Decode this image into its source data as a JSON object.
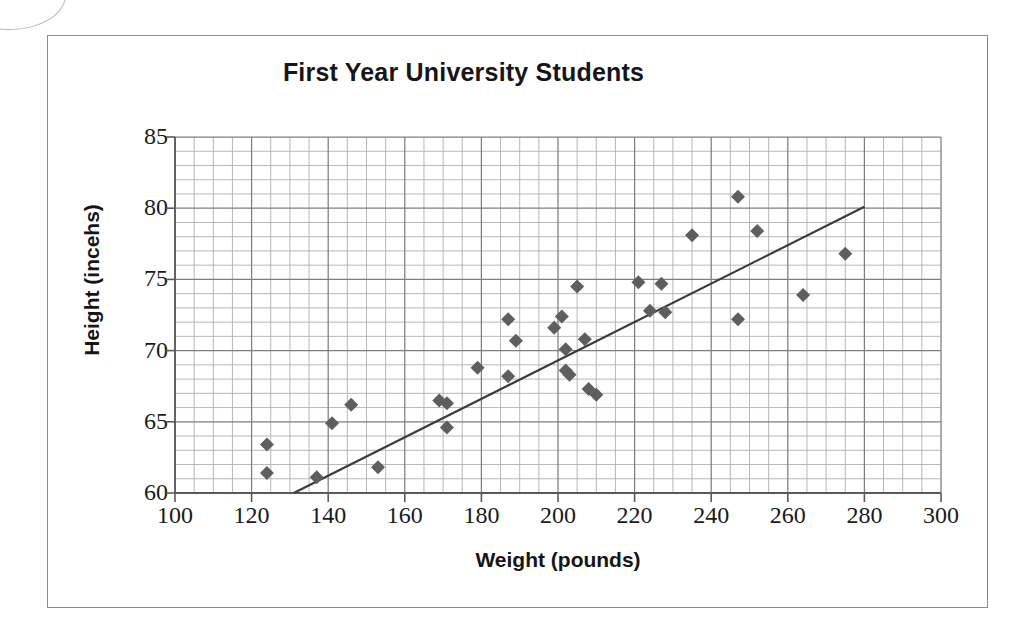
{
  "chart_data": {
    "type": "scatter",
    "title": "First Year University Students",
    "xlabel": "Weight (pounds)",
    "ylabel": "Height (incehs)",
    "xlim": [
      100,
      300
    ],
    "ylim": [
      60,
      85
    ],
    "x_major_ticks": [
      100,
      120,
      140,
      160,
      180,
      200,
      220,
      240,
      260,
      280,
      300
    ],
    "y_major_ticks": [
      60,
      65,
      70,
      75,
      80,
      85
    ],
    "x_minor_step": 5,
    "y_minor_step": 1,
    "grid": true,
    "legend": null,
    "marker": {
      "shape": "diamond",
      "color": "#5e5e5e",
      "size_px": 14
    },
    "points": [
      {
        "x": 124,
        "y": 63.4
      },
      {
        "x": 124,
        "y": 61.4
      },
      {
        "x": 137,
        "y": 61.1
      },
      {
        "x": 141,
        "y": 64.9
      },
      {
        "x": 146,
        "y": 66.2
      },
      {
        "x": 153,
        "y": 61.8
      },
      {
        "x": 169,
        "y": 66.5
      },
      {
        "x": 171,
        "y": 66.3
      },
      {
        "x": 171,
        "y": 64.6
      },
      {
        "x": 179,
        "y": 68.8
      },
      {
        "x": 187,
        "y": 72.2
      },
      {
        "x": 187,
        "y": 68.2
      },
      {
        "x": 189,
        "y": 70.7
      },
      {
        "x": 199,
        "y": 71.6
      },
      {
        "x": 201,
        "y": 72.4
      },
      {
        "x": 202,
        "y": 70.1
      },
      {
        "x": 202,
        "y": 68.6
      },
      {
        "x": 203,
        "y": 68.3
      },
      {
        "x": 205,
        "y": 74.5
      },
      {
        "x": 207,
        "y": 70.8
      },
      {
        "x": 208,
        "y": 67.3
      },
      {
        "x": 210,
        "y": 66.9
      },
      {
        "x": 221,
        "y": 74.8
      },
      {
        "x": 227,
        "y": 74.7
      },
      {
        "x": 224,
        "y": 72.8
      },
      {
        "x": 228,
        "y": 72.7
      },
      {
        "x": 235,
        "y": 78.1
      },
      {
        "x": 247,
        "y": 80.8
      },
      {
        "x": 247,
        "y": 72.2
      },
      {
        "x": 252,
        "y": 78.4
      },
      {
        "x": 264,
        "y": 73.9
      },
      {
        "x": 275,
        "y": 76.8
      }
    ],
    "trendline": {
      "x_start": 131,
      "y_start": 60.0,
      "x_end": 280,
      "y_end": 80.1
    }
  }
}
